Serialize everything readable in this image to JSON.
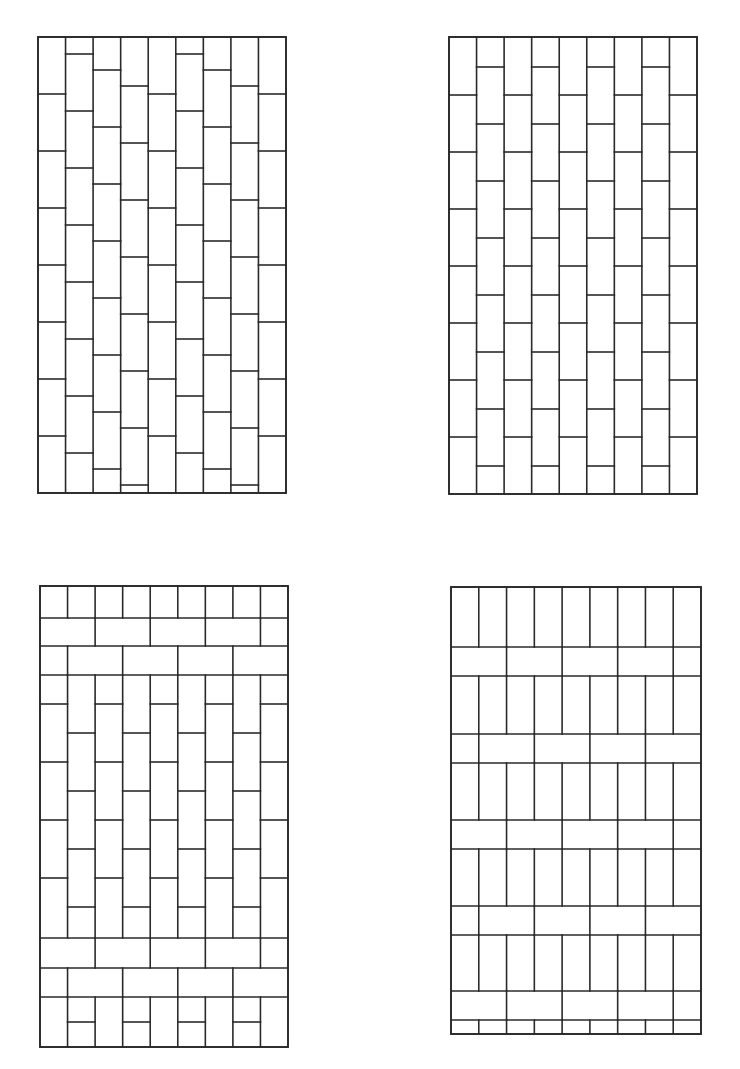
{
  "page": {
    "background": "#ffffff",
    "ink_color": "#2a2a2a"
  },
  "panels": [
    {
      "id": "top-left",
      "name": "stepped-running-bond-vertical",
      "frame": {
        "x": 38,
        "y": 37,
        "w": 248,
        "h": 456
      },
      "columns": 9,
      "pattern": "vertical bricks, joints offset stepwise across columns (diagonal stagger)"
    },
    {
      "id": "top-right",
      "name": "half-bond-vertical",
      "frame": {
        "x": 449,
        "y": 37,
        "w": 248,
        "h": 457
      },
      "columns": 9,
      "pattern": "vertical bricks, alternate columns offset by half a brick"
    },
    {
      "id": "bottom-left",
      "name": "vertical-half-bond-with-horizontal-bands",
      "frame": {
        "x": 40,
        "y": 586,
        "w": 248,
        "h": 461
      },
      "columns": 9,
      "pattern": "horizontal soldier/stretcher bands at top and bottom, vertical half-bond field between"
    },
    {
      "id": "bottom-right",
      "name": "vertical-stack-with-repeating-horizontal-bands",
      "frame": {
        "x": 451,
        "y": 587,
        "w": 250,
        "h": 447
      },
      "columns": 9,
      "pattern": "vertical bricks interrupted by repeating horizontal stretcher courses"
    }
  ]
}
